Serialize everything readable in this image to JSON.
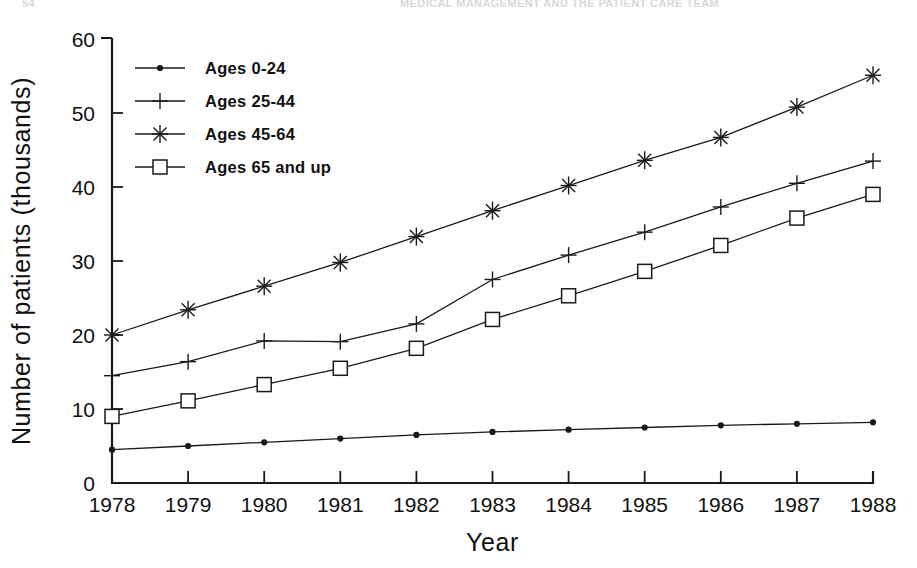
{
  "running_head": {
    "left": "54",
    "right": "MEDICAL MANAGEMENT AND THE PATIENT CARE TEAM"
  },
  "chart_data": {
    "type": "line",
    "title": "",
    "xlabel": "Year",
    "ylabel": "Number of patients (thousands)",
    "x": [
      1978,
      1979,
      1980,
      1981,
      1982,
      1983,
      1984,
      1985,
      1986,
      1987,
      1988
    ],
    "xticklabels": [
      "1978",
      "1979",
      "1980",
      "1981",
      "1982",
      "1983",
      "1984",
      "1985",
      "1986",
      "1987",
      "1988"
    ],
    "yticks": [
      0,
      10,
      20,
      30,
      40,
      50,
      60
    ],
    "yticklabels": [
      "0",
      "10",
      "20",
      "30",
      "40",
      "50",
      "60"
    ],
    "xlim": [
      1978,
      1988
    ],
    "ylim": [
      0,
      60
    ],
    "grid": false,
    "legend_position": "upper left",
    "series": [
      {
        "name": "Ages 0-24",
        "marker": "dot",
        "values": [
          4.5,
          5.0,
          5.5,
          6.0,
          6.5,
          6.9,
          7.2,
          7.5,
          7.8,
          8.0,
          8.2
        ]
      },
      {
        "name": "Ages 25-44",
        "marker": "plus",
        "values": [
          14.5,
          16.4,
          19.2,
          19.1,
          21.5,
          27.5,
          30.8,
          33.9,
          37.3,
          40.5,
          43.5
        ]
      },
      {
        "name": "Ages 45-64",
        "marker": "asterisk",
        "values": [
          20.0,
          23.4,
          26.6,
          29.8,
          33.3,
          36.8,
          40.2,
          43.6,
          46.7,
          50.8,
          55.1
        ]
      },
      {
        "name": "Ages 65 and up",
        "marker": "square",
        "values": [
          9.0,
          11.1,
          13.3,
          15.5,
          18.2,
          22.1,
          25.3,
          28.6,
          32.1,
          35.8,
          39.0
        ]
      }
    ]
  }
}
